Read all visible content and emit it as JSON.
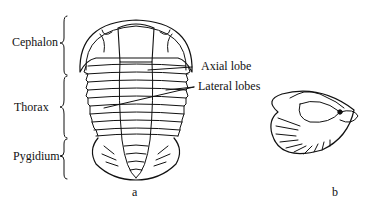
{
  "figure": {
    "regions": [
      {
        "id": "cephalon",
        "label": "Cephalon"
      },
      {
        "id": "thorax",
        "label": "Thorax"
      },
      {
        "id": "pygidium",
        "label": "Pygidium"
      }
    ],
    "callouts": [
      {
        "id": "axial",
        "label": "Axial lobe"
      },
      {
        "id": "lateral",
        "label": "Lateral lobes"
      }
    ],
    "panels": [
      {
        "id": "a",
        "label": "a"
      },
      {
        "id": "b",
        "label": "b"
      }
    ]
  }
}
